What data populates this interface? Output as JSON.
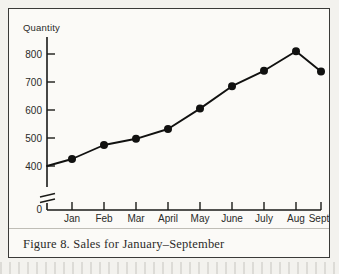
{
  "figure": {
    "caption": "Figure 8. Sales for January–September",
    "border_color": "#3a3a38",
    "background_color": "#fbfaf7"
  },
  "chart_data": {
    "type": "line",
    "title": "",
    "xlabel": "",
    "ylabel": "Quantity",
    "categories": [
      "Jan",
      "Feb",
      "Mar",
      "April",
      "May",
      "June",
      "July",
      "Aug",
      "Sept"
    ],
    "values": [
      425,
      475,
      497,
      532,
      605,
      685,
      740,
      810,
      738
    ],
    "series": [
      {
        "name": "Sales",
        "values": [
          425,
          475,
          497,
          532,
          605,
          685,
          740,
          810,
          738
        ]
      }
    ],
    "ylim": [
      400,
      830
    ],
    "ytick_labels": [
      "800",
      "700",
      "600",
      "500",
      "400"
    ],
    "ytick_values": [
      800,
      700,
      600,
      500,
      400
    ],
    "axis_origin_label": "0",
    "axis_break": true,
    "grid": false,
    "legend": false,
    "marker": "filled-circle",
    "line_color": "#111110",
    "marker_color": "#111110"
  }
}
